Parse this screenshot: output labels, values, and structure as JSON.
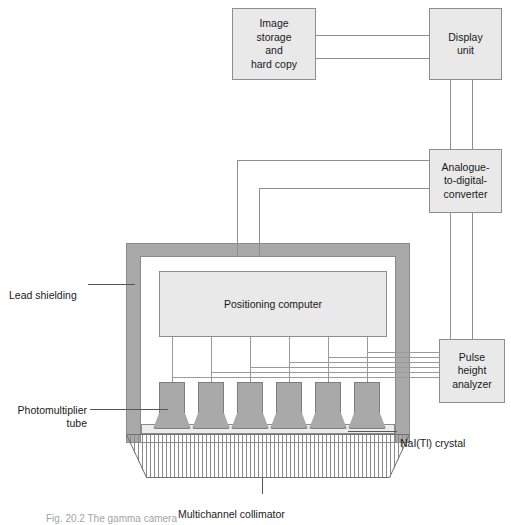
{
  "diagram": {
    "boxes": {
      "image_storage": "Image\nstorage\nand\nhard copy",
      "display_unit": "Display\nunit",
      "adc": "Analogue-\nto-digital-\nconverter",
      "pulse_height_analyzer": "Pulse\nheight\nanalyzer",
      "positioning_computer": "Positioning computer"
    },
    "annotations": {
      "lead_shielding": "Lead shielding",
      "photomultiplier_tube": "Photomultiplier\ntube",
      "nai_crystal": "NaI(Tl) crystal",
      "multichannel_collimator": "Multichannel collimator"
    },
    "caption": "Fig. 20.2 The gamma camera",
    "components": {
      "pmt_count": 6,
      "pha_signal_lines": 6,
      "adc_signal_lines": 2,
      "display_adc_lines": 2,
      "storage_display_lines": 2,
      "collimator_septa": 60
    },
    "colors": {
      "box_fill": "#e9e9e9",
      "box_stroke": "#8e8e8e",
      "shielding": "#a9a9a9",
      "pmt": "#a9a9a9",
      "crystal": "#ececec",
      "wire": "#8e8e8e",
      "text": "#1a1a1a",
      "caption": "#9fa4aa",
      "background": "#ffffff"
    }
  }
}
